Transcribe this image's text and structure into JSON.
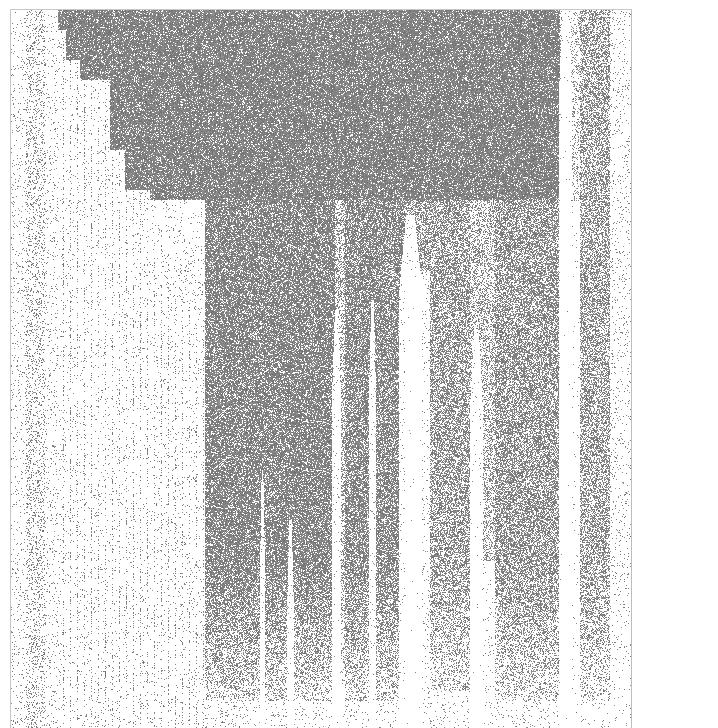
{
  "chart_data": {
    "type": "heatmap",
    "subtype": "sparsity-pattern",
    "title": "",
    "xlabel": "",
    "ylabel": "",
    "grid": false,
    "legend": null,
    "tick_labels": {
      "x": [],
      "y": []
    },
    "frame": {
      "x0": 10,
      "y0": 9,
      "x1": 632,
      "y1": 728
    },
    "colors": {
      "background": "#ffffff",
      "marker": "#808080",
      "frame": "#c8c8c8"
    },
    "staircase_boundary": [
      [
        58,
        9
      ],
      [
        66,
        30
      ],
      [
        80,
        60
      ],
      [
        95,
        120
      ],
      [
        110,
        80
      ],
      [
        125,
        150
      ],
      [
        150,
        190
      ],
      [
        165,
        230
      ],
      [
        180,
        280
      ],
      [
        195,
        300
      ],
      [
        205,
        320
      ]
    ],
    "columns": [
      {
        "x0": 12,
        "x1": 60,
        "density": 0.12,
        "y_end": 728
      },
      {
        "x0": 60,
        "x1": 80,
        "density": 0.08,
        "y_end": 620
      },
      {
        "x0": 205,
        "x1": 335,
        "density": 0.78,
        "y_end": 700
      },
      {
        "x0": 335,
        "x1": 345,
        "density": 0.4,
        "y_end": 680
      },
      {
        "x0": 345,
        "x1": 405,
        "density": 0.72,
        "y_end": 700
      },
      {
        "x0": 405,
        "x1": 430,
        "density": 0.55,
        "y_end": 270
      },
      {
        "x0": 430,
        "x1": 470,
        "density": 0.55,
        "y_end": 690
      },
      {
        "x0": 470,
        "x1": 495,
        "density": 0.35,
        "y_end": 560
      },
      {
        "x0": 495,
        "x1": 560,
        "density": 0.6,
        "y_end": 700
      },
      {
        "x0": 560,
        "x1": 580,
        "density": 0.2,
        "y_end": 200
      },
      {
        "x0": 580,
        "x1": 610,
        "density": 0.5,
        "y_end": 700
      },
      {
        "x0": 610,
        "x1": 630,
        "density": 0.06,
        "y_end": 728
      }
    ],
    "gaps": [
      {
        "x": 262,
        "y_start": 470,
        "width": 4
      },
      {
        "x": 290,
        "y_start": 520,
        "width": 6
      },
      {
        "x": 336,
        "y_start": 310,
        "width": 8
      },
      {
        "x": 372,
        "y_start": 300,
        "width": 6
      },
      {
        "x": 410,
        "y_start": 215,
        "width": 22
      },
      {
        "x": 476,
        "y_start": 330,
        "width": 12
      },
      {
        "x": 565,
        "y_start": 10,
        "width": 12
      }
    ],
    "top_band": {
      "y0": 9,
      "y1": 200,
      "density": 0.85
    }
  }
}
